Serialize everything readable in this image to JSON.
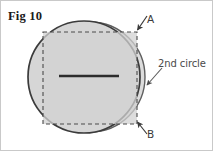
{
  "figure": {
    "caption": "Fig 10",
    "background_color": "#ffffff",
    "border_color": "#c9c9c9",
    "width": 213,
    "height": 151
  },
  "labels": {
    "point_a": "A",
    "point_b": "B",
    "annotation": "2nd circle"
  },
  "shapes": {
    "main_circle": {
      "name": "main-circle",
      "cx": 83,
      "cy": 76,
      "r": 56,
      "fill": "#d6d6d6",
      "stroke": "#3b3b3b",
      "stroke_width": 1.6
    },
    "second_circle": {
      "name": "second-circle",
      "cx": 89,
      "cy": 76,
      "r": 55,
      "fill": "none",
      "stroke": "#555555",
      "stroke_width": 1.4
    },
    "inscribed_square": {
      "name": "inscribed-square",
      "x": 42,
      "y": 31,
      "width": 94,
      "height": 92,
      "fill": "#d2d2d2",
      "stroke": "#4a4a4a",
      "stroke_width": 1.1,
      "dash": "4,3"
    },
    "center_segment": {
      "name": "center-segment",
      "x1": 58,
      "y1": 75,
      "x2": 118,
      "y2": 75,
      "stroke": "#2c2c2c",
      "stroke_width": 2.4
    },
    "annotation_arrow": {
      "name": "annotation-arrow",
      "x1": 160,
      "y1": 68,
      "x2": 145,
      "y2": 85,
      "stroke": "#5a5a5a",
      "stroke_width": 1.1
    },
    "arrow_a": {
      "name": "arrow-to-point-a",
      "x1": 146,
      "y1": 16,
      "x2": 136,
      "y2": 30,
      "stroke": "#444444",
      "stroke_width": 1.1
    },
    "arrow_b": {
      "name": "arrow-to-point-b",
      "x1": 146,
      "y1": 132,
      "x2": 136,
      "y2": 121,
      "stroke": "#444444",
      "stroke_width": 1.1
    }
  }
}
